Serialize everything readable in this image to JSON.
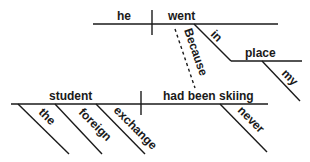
{
  "diagram": {
    "type": "sentence-diagram",
    "main_clause": {
      "subject": "student",
      "verb": "had been skiing",
      "subject_modifiers": [
        "the",
        "foreign",
        "exchange"
      ],
      "verb_modifiers": [
        "never"
      ]
    },
    "subordinate_clause": {
      "conjunction": "Because",
      "subject": "he",
      "verb": "went",
      "preposition": "in",
      "object_of_preposition": "place",
      "object_modifiers": [
        "my"
      ]
    }
  }
}
